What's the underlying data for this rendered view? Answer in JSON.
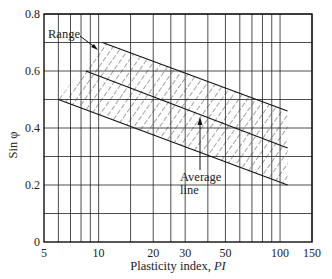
{
  "chart_data": {
    "type": "line",
    "title": "",
    "xlabel": "Plasticity index, PI",
    "xlabel_main": "Plasticity index, ",
    "xlabel_italic": "PI",
    "ylabel": "Sin φ",
    "xscale": "log",
    "xlim": [
      5,
      150
    ],
    "ylim": [
      0,
      0.8
    ],
    "grid": true,
    "x_ticks": [
      5,
      10,
      20,
      30,
      50,
      100,
      150
    ],
    "x_tick_labels": [
      "5",
      "10",
      "20",
      "30",
      "50",
      "100",
      "150"
    ],
    "y_ticks": [
      0,
      0.2,
      0.4,
      0.6,
      0.8
    ],
    "y_tick_labels": [
      "0",
      "0.2",
      "0.4",
      "0.6",
      "0.8"
    ],
    "x_minor_grid": [
      6,
      7,
      8,
      9,
      10,
      15,
      20,
      25,
      30,
      40,
      50,
      60,
      70,
      80,
      90,
      100,
      150
    ],
    "y_grid": [
      0.1,
      0.2,
      0.3,
      0.4,
      0.5,
      0.6,
      0.7,
      0.8
    ],
    "series": [
      {
        "name": "Range upper bound",
        "x": [
          6,
          10.5,
          110
        ],
        "y": [
          0.5,
          0.7,
          0.46
        ]
      },
      {
        "name": "Range lower bound",
        "x": [
          6,
          110
        ],
        "y": [
          0.5,
          0.2
        ]
      },
      {
        "name": "Average line",
        "x": [
          8.5,
          110
        ],
        "y": [
          0.6,
          0.33
        ]
      }
    ],
    "annotations": [
      {
        "text": "Range",
        "target": "hatched band upper-left corner"
      },
      {
        "text": "Average line",
        "line1": "Average",
        "line2": "line",
        "target": "average line"
      }
    ]
  }
}
